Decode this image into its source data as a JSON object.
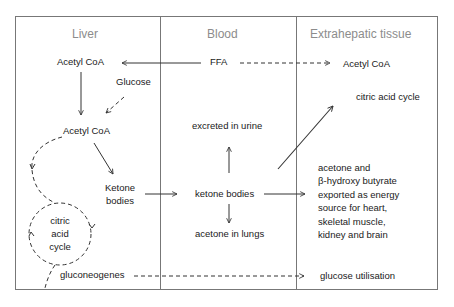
{
  "columns": {
    "liver": "Liver",
    "blood": "Blood",
    "tissue": "Extrahepatic tissue"
  },
  "liver": {
    "acetyl_coa_top": "Acetyl CoA",
    "glucose": "Glucose",
    "acetyl_coa_mid": "Acetyl CoA",
    "ketone_bodies": [
      "Ketone",
      "bodies"
    ],
    "citric_acid_cycle": [
      "citric",
      "acid",
      "cycle"
    ],
    "gluconeogenes": "gluconeogenes"
  },
  "blood": {
    "ffa": "FFA",
    "excreted": "excreted in urine",
    "ketone_bodies": "ketone bodies",
    "acetone_lungs": "acetone in lungs"
  },
  "tissue": {
    "acetyl_coa": "Acetyl CoA",
    "citric_acid_cycle": "citric acid cycle",
    "exported": [
      "acetone and",
      "β-hydroxy butyrate",
      "exported as energy",
      "source for heart,",
      "skeletal muscle,",
      "kidney and brain"
    ],
    "glucose_utilisation": "glucose utilisation"
  },
  "colors": {
    "line": "#333333",
    "frame": "#666666",
    "header": "#8c8c8c"
  }
}
